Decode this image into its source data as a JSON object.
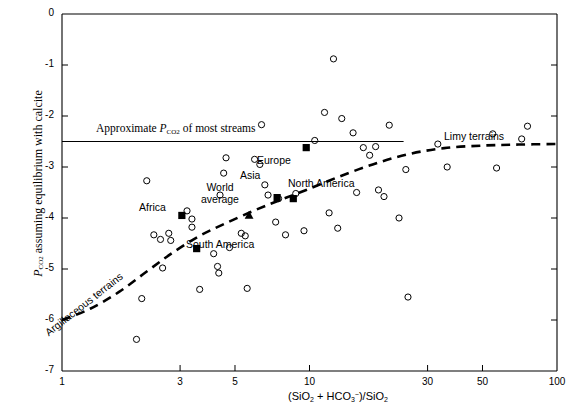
{
  "chart_data": {
    "type": "scatter",
    "title": "",
    "xlabel": "(SiO2 + HCO3-)/SiO2",
    "ylabel": "PCO2 assuming equilibrium with calcite",
    "xscale": "log",
    "xlim": [
      1,
      100
    ],
    "ylim": [
      -7,
      0
    ],
    "xticks": [
      1,
      3,
      5,
      10,
      30,
      50,
      100
    ],
    "xtick_labels": [
      "1",
      "3",
      "5",
      "10",
      "30",
      "50",
      "100"
    ],
    "yticks": [
      0,
      -1,
      -2,
      -3,
      -4,
      -5,
      -6,
      -7
    ],
    "ytick_labels": [
      "0",
      "-1",
      "-2",
      "-3",
      "-4",
      "-5",
      "-6",
      "-7"
    ],
    "grid": false,
    "legend": "none",
    "series": [
      {
        "name": "river samples",
        "marker": "open-circle",
        "points": [
          [
            2.0,
            -6.38
          ],
          [
            2.1,
            -5.58
          ],
          [
            2.55,
            -4.98
          ],
          [
            2.35,
            -4.33
          ],
          [
            2.5,
            -4.42
          ],
          [
            2.7,
            -4.3
          ],
          [
            2.75,
            -4.44
          ],
          [
            2.2,
            -3.27
          ],
          [
            3.35,
            -4.02
          ],
          [
            3.35,
            -4.18
          ],
          [
            3.2,
            -3.86
          ],
          [
            3.6,
            -5.4
          ],
          [
            4.1,
            -4.7
          ],
          [
            4.25,
            -4.95
          ],
          [
            4.3,
            -5.08
          ],
          [
            4.35,
            -3.55
          ],
          [
            4.5,
            -3.12
          ],
          [
            4.6,
            -2.82
          ],
          [
            4.75,
            -4.58
          ],
          [
            5.3,
            -4.3
          ],
          [
            5.5,
            -4.35
          ],
          [
            5.6,
            -5.38
          ],
          [
            6.0,
            -2.85
          ],
          [
            6.3,
            -2.95
          ],
          [
            6.4,
            -2.17
          ],
          [
            6.6,
            -3.35
          ],
          [
            6.8,
            -3.55
          ],
          [
            7.3,
            -4.08
          ],
          [
            7.5,
            -3.62
          ],
          [
            8.0,
            -4.33
          ],
          [
            8.8,
            -3.52
          ],
          [
            9.5,
            -4.25
          ],
          [
            10.5,
            -2.48
          ],
          [
            11.5,
            -1.93
          ],
          [
            12.0,
            -3.9
          ],
          [
            12.5,
            -0.88
          ],
          [
            13.5,
            -2.05
          ],
          [
            13.0,
            -4.2
          ],
          [
            15.0,
            -2.33
          ],
          [
            15.5,
            -3.5
          ],
          [
            16.5,
            -2.62
          ],
          [
            17.5,
            -2.77
          ],
          [
            18.5,
            -2.6
          ],
          [
            19.0,
            -3.45
          ],
          [
            20.0,
            -3.58
          ],
          [
            21.0,
            -2.18
          ],
          [
            23.0,
            -4.0
          ],
          [
            24.5,
            -3.05
          ],
          [
            25.0,
            -5.55
          ],
          [
            33.0,
            -2.55
          ],
          [
            36.0,
            -3.0
          ],
          [
            55.0,
            -2.35
          ],
          [
            57.0,
            -3.02
          ],
          [
            72.0,
            -2.45
          ],
          [
            76.0,
            -2.2
          ]
        ]
      },
      {
        "name": "continental averages",
        "marker": "filled-square",
        "points": [
          {
            "label": "Africa",
            "x": 3.05,
            "y": -3.95
          },
          {
            "label": "South America",
            "x": 3.5,
            "y": -4.6
          },
          {
            "label": "Asia",
            "x": 7.4,
            "y": -3.6
          },
          {
            "label": "Europe",
            "x": 9.7,
            "y": -2.62
          },
          {
            "label": "North America",
            "x": 8.6,
            "y": -3.62
          }
        ]
      },
      {
        "name": "world average",
        "marker": "filled-triangle",
        "points": [
          {
            "label": "World average",
            "x": 5.7,
            "y": -3.95
          }
        ]
      }
    ],
    "reference_line": {
      "label": "Approximate PCO2 of most streams",
      "y": -2.5,
      "x_from": 1.0,
      "x_to": 24.0,
      "style": "solid"
    },
    "trend_curve": {
      "style": "dashed",
      "left_label": "Argillaceous terrains",
      "right_label": "Limy terrains",
      "points": [
        [
          1.0,
          -6.0
        ],
        [
          1.3,
          -5.78
        ],
        [
          1.7,
          -5.45
        ],
        [
          2.2,
          -5.05
        ],
        [
          2.8,
          -4.68
        ],
        [
          3.6,
          -4.35
        ],
        [
          4.6,
          -4.1
        ],
        [
          6.0,
          -3.85
        ],
        [
          7.6,
          -3.65
        ],
        [
          9.7,
          -3.45
        ],
        [
          13.0,
          -3.2
        ],
        [
          18.0,
          -2.95
        ],
        [
          25.0,
          -2.75
        ],
        [
          35.0,
          -2.63
        ],
        [
          50.0,
          -2.58
        ],
        [
          70.0,
          -2.56
        ],
        [
          100.0,
          -2.55
        ]
      ]
    }
  },
  "annotations": {
    "reference_line_text": "Approximate ",
    "reference_line_sym": "P",
    "reference_line_sub": "CO",
    "reference_line_sub2": "2",
    "reference_line_tail": " of most streams",
    "limy": "Limy terrains",
    "argillaceous": "Argillaceous terrains",
    "africa": "Africa",
    "south_america": "South America",
    "asia": "Asia",
    "europe": "Europe",
    "north_america": "North America",
    "world_average_line1": "World",
    "world_average_line2": "average"
  },
  "axes": {
    "y_label_sym": "P",
    "y_label_sub": "CO",
    "y_label_sub_num": "2",
    "y_label_rest": " assuming equilibrium with calcite",
    "x_label_open": "(SiO",
    "x_label_2a": "2",
    "x_label_plus": " + HCO",
    "x_label_3": "3",
    "x_label_minus": "−",
    "x_label_close": ")/SiO",
    "x_label_2b": "2"
  },
  "colors": {
    "axis": "#000000",
    "marker": "#000000",
    "background": "#ffffff"
  }
}
